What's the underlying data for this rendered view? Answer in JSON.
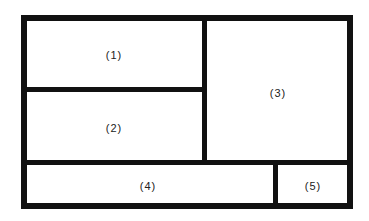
{
  "diagram": {
    "type": "layout-partition",
    "colors": {
      "line": "#111111",
      "background": "#ffffff"
    },
    "regions": [
      {
        "id": 1,
        "label": "(1)"
      },
      {
        "id": 2,
        "label": "(2)"
      },
      {
        "id": 3,
        "label": "(3)"
      },
      {
        "id": 4,
        "label": "(4)"
      },
      {
        "id": 5,
        "label": "(5)"
      }
    ]
  }
}
